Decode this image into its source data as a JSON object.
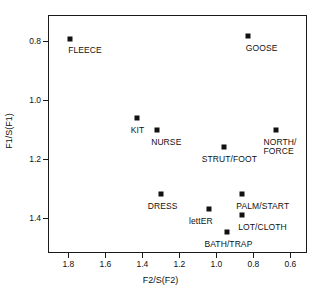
{
  "chart_data": {
    "type": "scatter",
    "title": "",
    "xlabel": "F2/S(F2)",
    "ylabel": "F1/S(F1)",
    "xlim": [
      1.91,
      0.51
    ],
    "ylim": [
      0.71,
      1.52
    ],
    "x_axis_reversed": true,
    "y_axis_reversed": true,
    "grid": false,
    "legend": "none",
    "xticks": [
      1.8,
      1.6,
      1.4,
      1.2,
      1.0,
      0.8,
      0.6
    ],
    "xticklabels": [
      "1.8",
      "1.6",
      "1.4",
      "1.2",
      "1.0",
      "0.8",
      "0.6"
    ],
    "yticks": [
      0.8,
      1.0,
      1.2,
      1.4
    ],
    "yticklabels": [
      "0.8",
      "1.0",
      "1.2",
      "1.4"
    ],
    "points": [
      {
        "label": "FLEECE",
        "x": 1.79,
        "y": 0.79,
        "label_dx": -2,
        "label_dy": 7
      },
      {
        "label": "GOOSE",
        "x": 0.83,
        "y": 0.78,
        "label_dx": -2,
        "label_dy": 8
      },
      {
        "label": "KIT",
        "x": 1.43,
        "y": 1.06,
        "label_dx": -6,
        "label_dy": 8
      },
      {
        "label": "NURSE",
        "x": 1.32,
        "y": 1.1,
        "label_dx": -6,
        "label_dy": 8
      },
      {
        "label": "STRUT/FOOT",
        "x": 0.96,
        "y": 1.16,
        "label_dx": -22,
        "label_dy": 8
      },
      {
        "label": "NORTH/\nFORCE",
        "x": 0.68,
        "y": 1.1,
        "label_dx": -12,
        "label_dy": 8
      },
      {
        "label": "DRESS",
        "x": 1.3,
        "y": 1.32,
        "label_dx": -13,
        "label_dy": 8
      },
      {
        "label": "PALM/START",
        "x": 0.86,
        "y": 1.32,
        "label_dx": -6,
        "label_dy": 8
      },
      {
        "label": "lettER",
        "x": 1.04,
        "y": 1.37,
        "label_dx": -20,
        "label_dy": 8
      },
      {
        "label": "LOT/CLOTH",
        "x": 0.86,
        "y": 1.39,
        "label_dx": -4,
        "label_dy": 8
      },
      {
        "label": "BATH/TRAP",
        "x": 0.94,
        "y": 1.45,
        "label_dx": -23,
        "label_dy": 8
      }
    ]
  }
}
